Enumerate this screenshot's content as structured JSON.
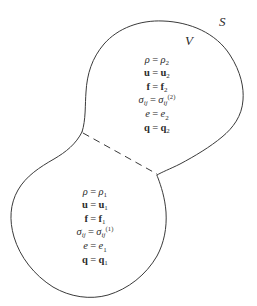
{
  "figure": {
    "title": "",
    "stroke_color": "#3a3a3a",
    "background_color": "#ffffff",
    "labels": {
      "surface": "S",
      "volume": "V"
    },
    "regions": [
      {
        "id": "upper",
        "name": "region-2",
        "subscript": "2",
        "superscript": "(2)",
        "equations": [
          {
            "lhs": "ρ",
            "lhs_style": "italic",
            "rhs": "ρ",
            "rhs_style": "italic",
            "sub": "2",
            "sup": ""
          },
          {
            "lhs": "u",
            "lhs_style": "bold",
            "rhs": "u",
            "rhs_style": "bold",
            "sub": "2",
            "sup": ""
          },
          {
            "lhs": "f",
            "lhs_style": "bold",
            "rhs": "f",
            "rhs_style": "bold",
            "sub": "2",
            "sup": ""
          },
          {
            "lhs": "σ",
            "lhs_style": "italic",
            "lhs_sub": "ij",
            "rhs": "σ",
            "rhs_style": "italic",
            "sub": "ij",
            "sup": "(2)"
          },
          {
            "lhs": "e",
            "lhs_style": "italic",
            "rhs": "e",
            "rhs_style": "italic",
            "sub": "2",
            "sup": ""
          },
          {
            "lhs": "q",
            "lhs_style": "bold",
            "rhs": "q",
            "rhs_style": "bold",
            "sub": "2",
            "sup": ""
          }
        ],
        "lines_plain": [
          "ρ = ρ₂",
          "u = u₂",
          "f = f₂",
          "σ_ij = σ_ij^(2)",
          "e = e₂",
          "q = q₂"
        ]
      },
      {
        "id": "lower",
        "name": "region-1",
        "subscript": "1",
        "superscript": "(1)",
        "equations": [
          {
            "lhs": "ρ",
            "lhs_style": "italic",
            "rhs": "ρ",
            "rhs_style": "italic",
            "sub": "1",
            "sup": ""
          },
          {
            "lhs": "u",
            "lhs_style": "bold",
            "rhs": "u",
            "rhs_style": "bold",
            "sub": "1",
            "sup": ""
          },
          {
            "lhs": "f",
            "lhs_style": "bold",
            "rhs": "f",
            "rhs_style": "bold",
            "sub": "1",
            "sup": ""
          },
          {
            "lhs": "σ",
            "lhs_style": "italic",
            "lhs_sub": "ij",
            "rhs": "σ",
            "rhs_style": "italic",
            "sub": "ij",
            "sup": "(1)"
          },
          {
            "lhs": "e",
            "lhs_style": "italic",
            "rhs": "e",
            "rhs_style": "italic",
            "sub": "1",
            "sup": ""
          },
          {
            "lhs": "q",
            "lhs_style": "bold",
            "rhs": "q",
            "rhs_style": "bold",
            "sub": "1",
            "sup": ""
          }
        ],
        "lines_plain": [
          "ρ = ρ₁",
          "u = u₁",
          "f = f₁",
          "σ_ij = σ_ij^(1)",
          "e = e₁",
          "q = q₁"
        ]
      }
    ],
    "equals_sign": "=",
    "divider": {
      "style": "dashed",
      "name": "interface-line"
    }
  }
}
